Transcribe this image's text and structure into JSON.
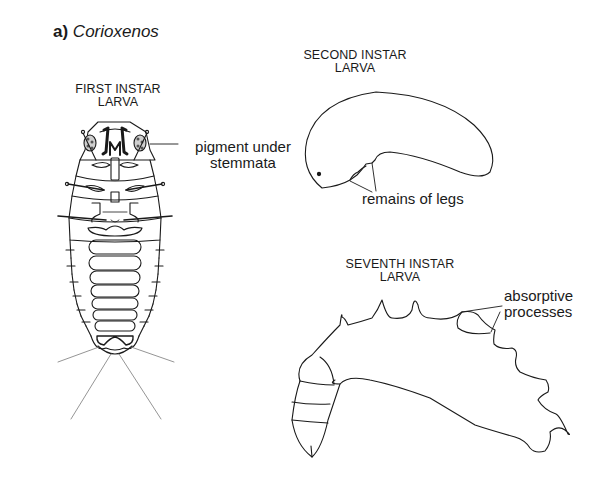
{
  "figure": {
    "panel_letter": "a)",
    "genus": "Corioxenos"
  },
  "stages": [
    {
      "id": "first",
      "title_line1": "FIRST INSTAR",
      "title_line2": "LARVA"
    },
    {
      "id": "second",
      "title_line1": "SECOND INSTAR",
      "title_line2": "LARVA"
    },
    {
      "id": "seventh",
      "title_line1": "SEVENTH INSTAR",
      "title_line2": "LARVA"
    }
  ],
  "annotations": {
    "pigment_line1": "pigment under",
    "pigment_line2": "stemmata",
    "legs": "remains of legs",
    "absorptive_line1": "absorptive",
    "absorptive_line2": "processes"
  },
  "colors": {
    "ink": "#1a1a1a",
    "background": "#ffffff"
  }
}
